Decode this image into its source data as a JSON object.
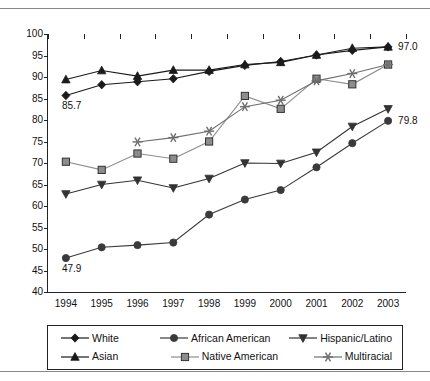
{
  "chart_data": {
    "type": "line",
    "title": "",
    "subtitle": "",
    "xlabel": "",
    "ylabel": "",
    "categories": [
      "1994",
      "1995",
      "1996",
      "1997",
      "1998",
      "1999",
      "2000",
      "2001",
      "2002",
      "2003"
    ],
    "x": [
      1994,
      1995,
      1996,
      1997,
      1998,
      1999,
      2000,
      2001,
      2002,
      2003
    ],
    "ylim": [
      40,
      100
    ],
    "ytick_step": 5,
    "yticks": [
      40,
      45,
      50,
      55,
      60,
      65,
      70,
      75,
      80,
      85,
      90,
      95,
      100
    ],
    "grid": false,
    "legend_position": "bottom",
    "series": [
      {
        "name": "White",
        "marker": "diamond",
        "color": "#1a1a1a",
        "values": [
          85.7,
          88.2,
          88.9,
          89.6,
          91.3,
          92.7,
          93.6,
          95.1,
          96.2,
          97.0
        ]
      },
      {
        "name": "African American",
        "marker": "circle",
        "color": "#3a3a3a",
        "values": [
          47.9,
          50.4,
          50.9,
          51.5,
          58.0,
          61.5,
          63.7,
          69.0,
          74.6,
          79.8
        ]
      },
      {
        "name": "Hispanic/Latino",
        "marker": "triangle-down",
        "color": "#333333",
        "values": [
          62.8,
          65.0,
          66.0,
          64.2,
          66.4,
          70.0,
          69.9,
          72.5,
          78.5,
          82.6
        ]
      },
      {
        "name": "Asian",
        "marker": "triangle-up",
        "color": "#1a1a1a",
        "values": [
          89.4,
          91.5,
          90.2,
          91.6,
          91.6,
          92.9,
          93.4,
          95.1,
          96.7,
          97.0
        ]
      },
      {
        "name": "Native American",
        "marker": "square",
        "color": "#8c8c8c",
        "values": [
          70.3,
          68.4,
          72.2,
          71.0,
          75.0,
          85.6,
          82.6,
          89.6,
          88.3,
          92.9
        ]
      },
      {
        "name": "Multiracial",
        "marker": "asterisk",
        "color": "#6e6e6e",
        "values": [
          null,
          null,
          74.9,
          75.9,
          77.4,
          83.1,
          84.6,
          89.1,
          90.8,
          92.9
        ]
      }
    ],
    "annotations": [
      {
        "text": "85.7",
        "series": "White",
        "x": 1994,
        "y": 85.7,
        "position": "below"
      },
      {
        "text": "47.9",
        "series": "African American",
        "x": 1994,
        "y": 47.9,
        "position": "below"
      },
      {
        "text": "97.0",
        "series": "White",
        "x": 2003,
        "y": 97.0,
        "position": "right"
      },
      {
        "text": "79.8",
        "series": "African American",
        "x": 2003,
        "y": 79.8,
        "position": "right"
      }
    ]
  },
  "legend": {
    "rows": [
      [
        {
          "label": "White",
          "marker": "diamond"
        },
        {
          "label": "African American",
          "marker": "circle"
        },
        {
          "label": "Hispanic/Latino",
          "marker": "triangle-down"
        }
      ],
      [
        {
          "label": "Asian",
          "marker": "triangle-up"
        },
        {
          "label": "Native American",
          "marker": "square"
        },
        {
          "label": "Multiracial",
          "marker": "asterisk"
        }
      ]
    ]
  }
}
